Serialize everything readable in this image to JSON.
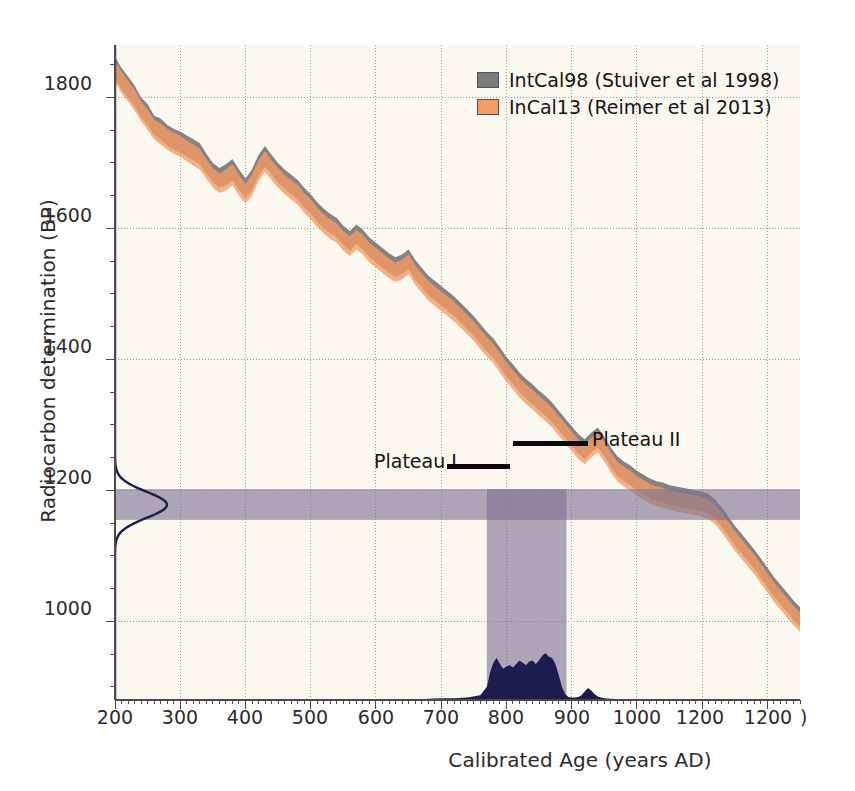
{
  "chart_data": {
    "type": "area",
    "title": "",
    "xlabel": "Calibrated Age (years AD)",
    "ylabel": "Radiocarbon determination (BP)",
    "xlim": [
      200,
      1250
    ],
    "ylim": [
      880,
      1880
    ],
    "xticks": [
      200,
      300,
      400,
      500,
      600,
      700,
      800,
      900,
      1000,
      1100,
      1200
    ],
    "xticklabels": [
      "200",
      "300",
      "400",
      "500",
      "600",
      "700",
      "800",
      "900",
      "1000",
      "1200",
      "1200"
    ],
    "yticks": [
      1000,
      1200,
      1400,
      1600,
      1800
    ],
    "yticklabels": [
      "1000",
      "1200",
      "1400",
      "1600",
      "1800"
    ],
    "grid": true,
    "legend_position": "top-right",
    "x": [
      200,
      210,
      220,
      230,
      240,
      250,
      260,
      270,
      280,
      290,
      300,
      310,
      320,
      330,
      340,
      350,
      360,
      370,
      380,
      390,
      400,
      410,
      420,
      430,
      440,
      450,
      460,
      470,
      480,
      490,
      500,
      510,
      520,
      530,
      540,
      550,
      560,
      570,
      580,
      590,
      600,
      610,
      620,
      630,
      640,
      650,
      660,
      670,
      680,
      690,
      700,
      710,
      720,
      730,
      740,
      750,
      760,
      770,
      780,
      790,
      800,
      810,
      820,
      830,
      840,
      850,
      860,
      870,
      880,
      890,
      900,
      910,
      920,
      930,
      940,
      950,
      960,
      970,
      980,
      990,
      1000,
      1010,
      1020,
      1030,
      1040,
      1050,
      1060,
      1070,
      1080,
      1090,
      1100,
      1110,
      1120,
      1130,
      1140,
      1150,
      1160,
      1170,
      1180,
      1190,
      1200,
      1210,
      1220,
      1230,
      1240,
      1250
    ],
    "series": [
      {
        "name": "IntCal98 (Stuiver et al 1998)",
        "color": "#7c7c80",
        "upper": [
          1862,
          1845,
          1832,
          1818,
          1800,
          1790,
          1772,
          1768,
          1758,
          1752,
          1748,
          1742,
          1736,
          1730,
          1714,
          1700,
          1692,
          1698,
          1706,
          1690,
          1676,
          1690,
          1712,
          1726,
          1712,
          1700,
          1690,
          1682,
          1674,
          1662,
          1652,
          1640,
          1630,
          1622,
          1616,
          1604,
          1596,
          1606,
          1598,
          1586,
          1578,
          1570,
          1562,
          1556,
          1560,
          1568,
          1552,
          1540,
          1528,
          1520,
          1512,
          1504,
          1496,
          1486,
          1476,
          1466,
          1454,
          1442,
          1432,
          1418,
          1404,
          1392,
          1380,
          1370,
          1362,
          1352,
          1344,
          1334,
          1322,
          1310,
          1298,
          1286,
          1278,
          1288,
          1296,
          1282,
          1266,
          1252,
          1244,
          1238,
          1230,
          1224,
          1218,
          1214,
          1212,
          1208,
          1206,
          1204,
          1202,
          1200,
          1198,
          1194,
          1186,
          1174,
          1160,
          1146,
          1134,
          1122,
          1110,
          1096,
          1082,
          1068,
          1056,
          1044,
          1032,
          1022
        ],
        "lower": [
          1830,
          1812,
          1800,
          1786,
          1770,
          1758,
          1742,
          1736,
          1726,
          1720,
          1716,
          1710,
          1704,
          1698,
          1684,
          1670,
          1662,
          1666,
          1674,
          1658,
          1646,
          1658,
          1680,
          1694,
          1682,
          1670,
          1660,
          1652,
          1644,
          1632,
          1622,
          1610,
          1600,
          1592,
          1586,
          1574,
          1566,
          1576,
          1568,
          1556,
          1548,
          1540,
          1532,
          1526,
          1530,
          1538,
          1522,
          1510,
          1498,
          1490,
          1482,
          1474,
          1466,
          1456,
          1446,
          1436,
          1424,
          1412,
          1402,
          1388,
          1374,
          1362,
          1350,
          1340,
          1332,
          1322,
          1314,
          1304,
          1292,
          1280,
          1268,
          1256,
          1248,
          1258,
          1266,
          1252,
          1236,
          1222,
          1214,
          1208,
          1200,
          1194,
          1188,
          1184,
          1182,
          1178,
          1176,
          1174,
          1172,
          1170,
          1168,
          1164,
          1156,
          1144,
          1130,
          1116,
          1104,
          1092,
          1080,
          1066,
          1052,
          1038,
          1026,
          1014,
          1002,
          992
        ]
      },
      {
        "name": "InCal13 (Reimer et al 2013)",
        "color": "#f79a63",
        "upper": [
          1856,
          1840,
          1826,
          1812,
          1794,
          1782,
          1766,
          1760,
          1752,
          1746,
          1742,
          1734,
          1728,
          1722,
          1706,
          1692,
          1684,
          1690,
          1698,
          1682,
          1668,
          1682,
          1704,
          1718,
          1704,
          1692,
          1682,
          1674,
          1666,
          1654,
          1644,
          1632,
          1622,
          1614,
          1608,
          1596,
          1588,
          1598,
          1590,
          1578,
          1570,
          1562,
          1554,
          1548,
          1552,
          1560,
          1544,
          1532,
          1520,
          1512,
          1504,
          1496,
          1488,
          1478,
          1468,
          1458,
          1446,
          1434,
          1424,
          1410,
          1396,
          1384,
          1372,
          1362,
          1354,
          1344,
          1336,
          1326,
          1314,
          1302,
          1290,
          1278,
          1270,
          1280,
          1288,
          1274,
          1258,
          1244,
          1236,
          1230,
          1222,
          1216,
          1210,
          1206,
          1204,
          1200,
          1198,
          1196,
          1194,
          1192,
          1190,
          1186,
          1178,
          1166,
          1152,
          1138,
          1126,
          1114,
          1102,
          1088,
          1074,
          1060,
          1048,
          1036,
          1024,
          1014
        ],
        "lower": [
          1824,
          1806,
          1794,
          1780,
          1764,
          1750,
          1736,
          1728,
          1720,
          1714,
          1710,
          1702,
          1696,
          1690,
          1676,
          1662,
          1654,
          1658,
          1666,
          1650,
          1638,
          1650,
          1672,
          1686,
          1674,
          1662,
          1652,
          1644,
          1636,
          1624,
          1614,
          1602,
          1592,
          1584,
          1578,
          1566,
          1558,
          1568,
          1560,
          1548,
          1540,
          1532,
          1524,
          1518,
          1522,
          1530,
          1514,
          1502,
          1490,
          1482,
          1474,
          1466,
          1458,
          1448,
          1438,
          1428,
          1416,
          1404,
          1394,
          1380,
          1366,
          1354,
          1342,
          1332,
          1324,
          1314,
          1306,
          1296,
          1284,
          1272,
          1260,
          1248,
          1240,
          1250,
          1258,
          1244,
          1228,
          1214,
          1206,
          1200,
          1192,
          1186,
          1180,
          1176,
          1174,
          1170,
          1168,
          1166,
          1164,
          1162,
          1160,
          1156,
          1148,
          1136,
          1122,
          1108,
          1096,
          1084,
          1072,
          1058,
          1044,
          1030,
          1018,
          1006,
          994,
          984
        ]
      }
    ],
    "highlight_band": {
      "radiocarbon_range": [
        1155,
        1202
      ],
      "calibrated_range": [
        770,
        892
      ],
      "color": "#7d7293"
    },
    "radiocarbon_pdf": {
      "label": "radiocarbon determination probability",
      "color": "#1c1c4e",
      "mean": 1178,
      "sigma": 20
    },
    "calibrated_pdf": {
      "label": "calibrated age probability",
      "color": "#1c1c4e",
      "x": [
        200,
        660,
        680,
        700,
        720,
        740,
        760,
        770,
        775,
        780,
        785,
        790,
        795,
        800,
        805,
        810,
        815,
        820,
        825,
        830,
        835,
        840,
        845,
        850,
        855,
        860,
        865,
        870,
        875,
        880,
        885,
        890,
        895,
        900,
        905,
        910,
        915,
        920,
        925,
        930,
        935,
        940,
        945,
        950,
        960,
        980,
        1000,
        1250
      ],
      "y": [
        0.0,
        0.0,
        0.02,
        0.03,
        0.03,
        0.04,
        0.08,
        0.22,
        0.46,
        0.62,
        0.7,
        0.6,
        0.52,
        0.56,
        0.58,
        0.54,
        0.6,
        0.66,
        0.62,
        0.58,
        0.64,
        0.66,
        0.6,
        0.66,
        0.74,
        0.78,
        0.72,
        0.7,
        0.6,
        0.42,
        0.22,
        0.1,
        0.05,
        0.04,
        0.04,
        0.05,
        0.08,
        0.14,
        0.2,
        0.16,
        0.1,
        0.06,
        0.04,
        0.03,
        0.02,
        0.01,
        0.0,
        0.0
      ]
    },
    "annotations": [
      {
        "text": "Plateau I",
        "x_range": [
          690,
          775
        ],
        "y": 1198
      },
      {
        "text": "Plateau II",
        "x_range": [
          790,
          900
        ],
        "y": 1243
      }
    ]
  },
  "axes": {
    "ylabel": "Radiocarbon determination (BP)",
    "xlabel": "Calibrated Age (years AD)",
    "ytick_labels": [
      "1800",
      "1600",
      "1400",
      "1200",
      "1000"
    ],
    "xtick_labels": [
      "200",
      "300",
      "400",
      "500",
      "600",
      "700",
      "800",
      "900",
      "1000",
      "1200",
      "1200"
    ],
    "xaxis_trailing": ")"
  },
  "legend": {
    "entries": [
      {
        "label": "IntCal98 (Stuiver et al 1998)",
        "color": "#7c7c80"
      },
      {
        "label": "InCal13 (Reimer et al 2013)",
        "color": "#f79a63"
      }
    ]
  },
  "annotations": {
    "plateau_one": "Plateau I",
    "plateau_two": "Plateau II"
  },
  "colors": {
    "plot_background": "#faf8ef",
    "grid": "#9a9a92",
    "axis": "#4a4a46",
    "intcal98": "#7c7c80",
    "intcal13": "#f79a63",
    "highlight": "#7d7293",
    "pdf": "#1c1c4e",
    "text": "#2b2b2b"
  }
}
